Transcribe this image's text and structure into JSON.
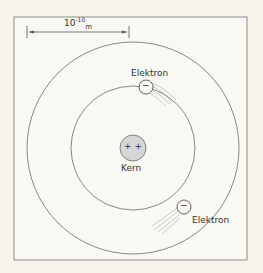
{
  "diagram": {
    "scale": {
      "base": "10",
      "exponent": "-10",
      "unit": "m"
    },
    "nucleus": {
      "charge": "+ +",
      "label": "Kern"
    },
    "electrons": [
      {
        "label": "Elektron",
        "symbol": "−"
      },
      {
        "label": "Elektron",
        "symbol": "−"
      }
    ],
    "colors": {
      "line": "#6b6b6b",
      "nucleus_fill": "#d6d6d6",
      "background": "#f7f4ec"
    }
  }
}
